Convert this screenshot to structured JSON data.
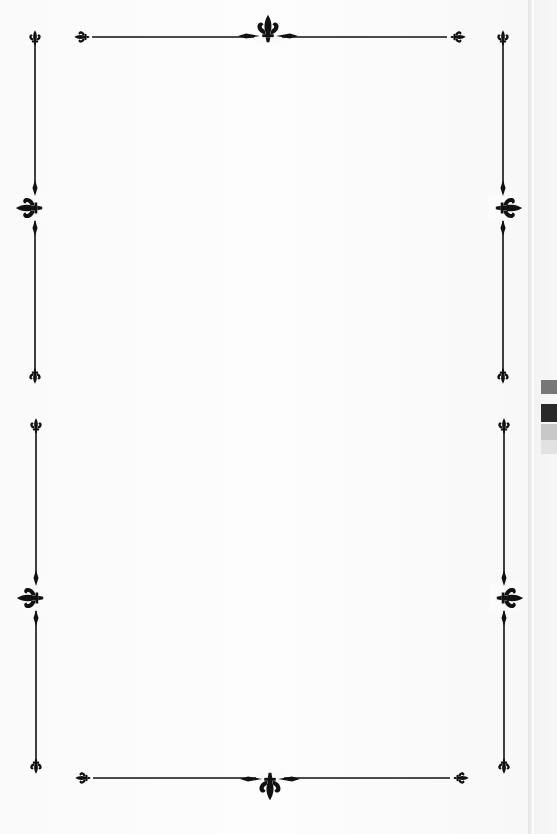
{
  "page": {
    "type": "decorative-border-page",
    "content_text": "",
    "ornament": "fleur-de-lis",
    "colors": {
      "background": "#fbfbfb",
      "ink": "#111111",
      "page_edge": "#e4e4e4",
      "tab_dark": "#2a2a2a",
      "tab_mid": "#777777"
    }
  },
  "borders": {
    "top": {
      "x1": 90,
      "x2": 452,
      "y": 37,
      "center_x": 268
    },
    "bottom": {
      "x1": 90,
      "x2": 454,
      "y": 778,
      "center_x": 270
    },
    "left_upper": {
      "x": 35,
      "y1": 37,
      "y2": 377,
      "center_y": 207
    },
    "left_lower": {
      "x": 36,
      "y1": 425,
      "y2": 768,
      "center_y": 597
    },
    "right_upper": {
      "x": 503,
      "y1": 37,
      "y2": 377,
      "center_y": 207
    },
    "right_lower": {
      "x": 504,
      "y1": 425,
      "y2": 768,
      "center_y": 597
    }
  },
  "icons": [
    "fleur-de-lis-icon",
    "diamond-icon"
  ]
}
